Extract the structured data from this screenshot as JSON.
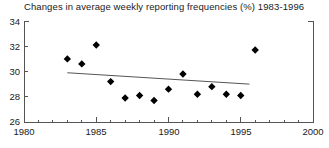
{
  "chart_data": {
    "type": "scatter",
    "title": "Changes in average weekly reporting frequencies (%) 1983-1996",
    "xlabel": "",
    "ylabel": "",
    "xlim": [
      1980,
      2000
    ],
    "ylim": [
      26,
      34
    ],
    "xticks": [
      1980,
      1985,
      1990,
      1995,
      2000
    ],
    "yticks": [
      26,
      28,
      30,
      32,
      34
    ],
    "xtick_labels": [
      "1980",
      "1985",
      "1990",
      "1995",
      "2000"
    ],
    "ytick_labels": [
      "26",
      "28",
      "30",
      "32",
      "34"
    ],
    "x_minor_ticks": [
      1981,
      1982,
      1983,
      1984,
      1986,
      1987,
      1988,
      1989,
      1991,
      1992,
      1993,
      1994,
      1996,
      1997,
      1998,
      1999
    ],
    "grid": false,
    "legend": null,
    "marker": "filled-diamond",
    "marker_color": "#000000",
    "line_color": "#555555",
    "frame_color": "#555555",
    "background": "#ffffff",
    "x": [
      1983,
      1984,
      1985,
      1986,
      1987,
      1988,
      1989,
      1990,
      1991,
      1992,
      1993,
      1994,
      1995,
      1996
    ],
    "values": [
      31.0,
      30.6,
      32.1,
      29.2,
      27.9,
      28.1,
      27.7,
      28.6,
      29.8,
      28.2,
      28.8,
      28.2,
      28.1,
      31.7
    ],
    "series": [
      {
        "name": "Average weekly reporting frequency",
        "x": [
          1983,
          1984,
          1985,
          1986,
          1987,
          1988,
          1989,
          1990,
          1991,
          1992,
          1993,
          1994,
          1995,
          1996
        ],
        "values": [
          31.0,
          30.6,
          32.1,
          29.2,
          27.9,
          28.1,
          27.7,
          28.6,
          29.8,
          28.2,
          28.8,
          28.2,
          28.1,
          31.7
        ]
      }
    ],
    "trendline": {
      "name": "linear-fit",
      "x": [
        1983.0,
        1995.6
      ],
      "values": [
        29.9,
        29.0
      ]
    }
  }
}
